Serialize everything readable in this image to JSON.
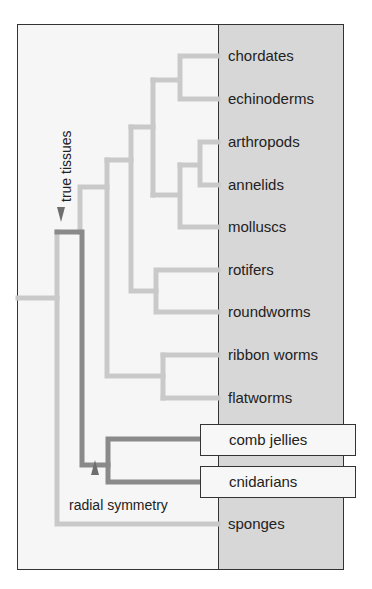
{
  "diagram": {
    "title": "",
    "type": "phylogenetic-tree",
    "colors": {
      "background": "#f6f6f6",
      "label_panel": "#d7d7d7",
      "branch_light": "#c9c9c9",
      "branch_dark": "#8a8a8a",
      "marker": "#6e6e6e",
      "highlight_box": "#f7f7f7"
    },
    "taxa": [
      {
        "label": "chordates"
      },
      {
        "label": "echinoderms"
      },
      {
        "label": "arthropods"
      },
      {
        "label": "annelids"
      },
      {
        "label": "molluscs"
      },
      {
        "label": "rotifers"
      },
      {
        "label": "roundworms"
      },
      {
        "label": "ribbon worms"
      },
      {
        "label": "flatworms"
      },
      {
        "label": "comb jellies",
        "highlighted": true
      },
      {
        "label": "cnidarians",
        "highlighted": true
      },
      {
        "label": "sponges"
      }
    ],
    "annotations": {
      "true_tissues": "true tissues",
      "radial_symmetry": "radial symmetry"
    },
    "clades": [
      {
        "members": [
          "chordates",
          "echinoderms"
        ]
      },
      {
        "members": [
          "arthropods",
          "annelids"
        ]
      },
      {
        "members": [
          "arthropods",
          "annelids",
          "molluscs"
        ]
      },
      {
        "members": [
          "chordates",
          "echinoderms",
          "arthropods",
          "annelids",
          "molluscs"
        ]
      },
      {
        "members": [
          "rotifers",
          "roundworms"
        ]
      },
      {
        "members": [
          "ribbon worms",
          "flatworms"
        ]
      },
      {
        "members": [
          "comb jellies",
          "cnidarians"
        ],
        "label": "radial symmetry"
      },
      {
        "members": [
          "all except sponges"
        ],
        "label": "true tissues"
      }
    ]
  }
}
